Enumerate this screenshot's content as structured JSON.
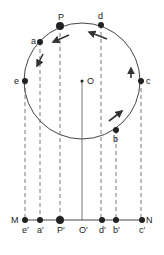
{
  "diagram": {
    "circle": {
      "cx": 82,
      "cy": 81,
      "r": 58
    },
    "center_label": "O",
    "circle_points": [
      {
        "label": "P",
        "x": 60,
        "y": 26,
        "big": true
      },
      {
        "label": "d",
        "x": 101,
        "y": 25
      },
      {
        "label": "a",
        "x": 40,
        "y": 42
      },
      {
        "label": "e",
        "x": 25,
        "y": 81
      },
      {
        "label": "c",
        "x": 141,
        "y": 81
      },
      {
        "label": "b",
        "x": 116,
        "y": 130
      }
    ],
    "line": {
      "y": 220,
      "x1": 25,
      "x2": 142,
      "left_label": "M",
      "right_label": "N"
    },
    "projection_points": [
      {
        "label": "e′",
        "x": 25
      },
      {
        "label": "a′",
        "x": 40
      },
      {
        "label": "P′",
        "x": 60,
        "big": true
      },
      {
        "label": "O′",
        "x": 82
      },
      {
        "label": "d′",
        "x": 102
      },
      {
        "label": "b′",
        "x": 116
      },
      {
        "label": "c′",
        "x": 142
      }
    ]
  }
}
